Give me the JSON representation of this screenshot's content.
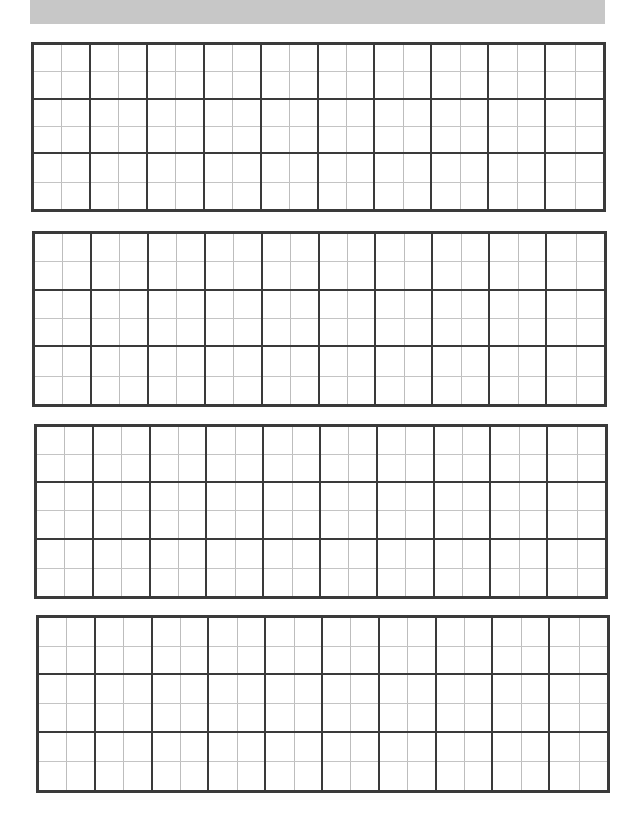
{
  "banner": {
    "title": "",
    "color": "#c7c7c7"
  },
  "worksheet": {
    "type": "character-practice-grid",
    "line_color_major": "#3a3a3a",
    "line_color_minor": "#bdbdbd",
    "grids": [
      {
        "id": "grid-1",
        "left": 31,
        "top": 42,
        "width": 575,
        "height": 170,
        "columns": 10,
        "rows": 3,
        "subdivisions": 2
      },
      {
        "id": "grid-2",
        "left": 32,
        "top": 231,
        "width": 575,
        "height": 176,
        "columns": 10,
        "rows": 3,
        "subdivisions": 2
      },
      {
        "id": "grid-3",
        "left": 34,
        "top": 424,
        "width": 574,
        "height": 175,
        "columns": 10,
        "rows": 3,
        "subdivisions": 2
      },
      {
        "id": "grid-4",
        "left": 36,
        "top": 615,
        "width": 574,
        "height": 178,
        "columns": 10,
        "rows": 3,
        "subdivisions": 2
      }
    ]
  }
}
